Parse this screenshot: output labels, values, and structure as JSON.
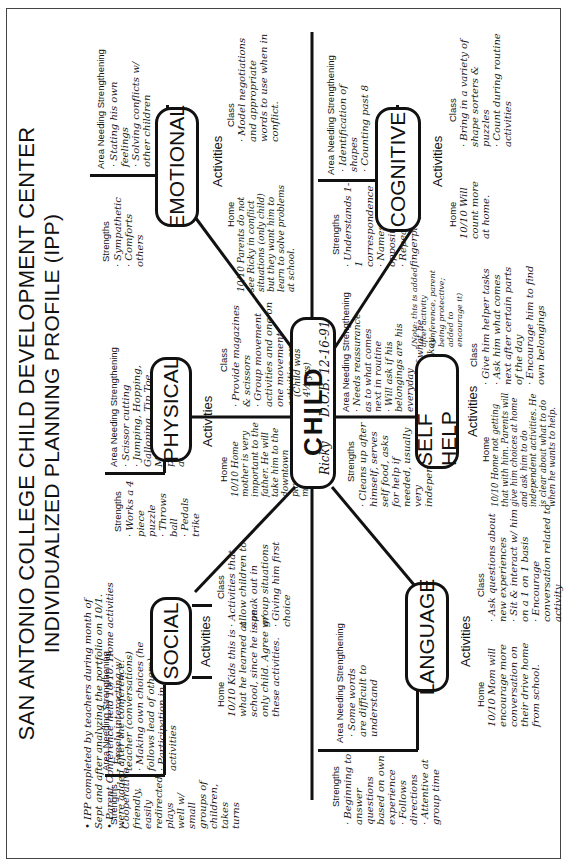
{
  "header": {
    "title_line1": "SAN ANTONIO COLLEGE CHILD DEVELOPMENT CENTER",
    "title_line2": "INDIVIDUALIZED PLANNING PROFILE (IPP)"
  },
  "notes": [
    "• IPP completed by teachers during month of Sept and after analyzing the portfolio on 10/1.",
    "• Parent Conference held 10/10. Home activities were added after the conference."
  ],
  "labels": {
    "strengths": "Strengths",
    "area_needing": "Area Needing Strengthening",
    "activities": "Activities",
    "home": "Home",
    "class": "Class"
  },
  "child": {
    "label": "CHILD",
    "age_note": "(Child was 4½ yrs)",
    "name": "Ricky",
    "dob": "D.O.B. 12-16-91"
  },
  "domains": {
    "social": {
      "label": "SOCIAL",
      "strengths": [
        "Cooperative, friendly, easily redirected, plays well w/ small groups of children, takes turns"
      ],
      "area_needing": [
        "· Freely interacting w/ teacher (conversations)",
        "· Making own choices (he follows lead of others)",
        "· Participation in group activities"
      ],
      "home": "10/10 Kids this is what he learned at school, since he is an only child. Agree w/ these activities.",
      "class": [
        "· Activities that allow children to speak out in group situations",
        "· Giving him first choice"
      ]
    },
    "physical": {
      "label": "PHYSICAL",
      "strengths": [
        "· Works a 4 piece puzzle",
        "· Throws ball",
        "· Pedals trike"
      ],
      "area_needing": [
        "· Scissor cutting",
        "· Jumping, Hopping, Galloping, Tip Toe, Marching (does not participate in these activities)"
      ],
      "home": "10/10 Home mother is very important to the father. He will take him to the downtown playground more often.",
      "class": [
        "· Provide magazines & scissors",
        "· Group movement activities and one on one movement activities on playground"
      ]
    },
    "emotional": {
      "label": "EMOTIONAL",
      "strengths": [
        "· Sympathetic",
        "· Comforts others"
      ],
      "area_needing": [
        "· Stating his own feelings",
        "· Solving conflicts w/ other children"
      ],
      "home": "10/10 Parents do not see Ricky in conflict situations (only child) but they want him to learn to solve problems at school.",
      "class": [
        "· Model negotiations and appropriate words to use when in conflict."
      ]
    },
    "language": {
      "label": "LANGUAGE",
      "strengths": [
        "· Beginning to answer questions based on own experience",
        "· Follows directions",
        "· Attentive at group time"
      ],
      "area_needing": [
        "· Some words are difficult to understand"
      ],
      "home": "10/10 Mom will encourage more conversation on their drive home from school.",
      "class": [
        "· Ask questions about new experiences",
        "· Sit & interact w/ him on a 1 on 1 basis",
        "· Encourage conversation related to activity"
      ]
    },
    "self_help": {
      "label": "SELF HELP",
      "strengths": [
        "· Cleans up after himself, serves self food, asks for help if needed, usually very independent"
      ],
      "area_needing": [
        "· Needs reassurance as to what comes next in routine",
        "· Will ask if his belongings are his everyday",
        "· Unsure if what he is doing is okay"
      ],
      "note": "(Note: this is added after activity conference, parent being protective; added to encourage it)",
      "home": "10/10 Home not getting that with him. Parents will give him choices at home and ask him to do independent activities. He is clear about what to do when he wants to help.",
      "class": [
        "· Give him helper tasks",
        "· Ask him what comes next after certain parts of the day",
        "· Encourage him to find own belongings"
      ]
    },
    "cognitive": {
      "label": "COGNITIVE",
      "strengths": [
        "· Understands 1-1 correspondence",
        "· Names opposites",
        "· Repeats fingerplays"
      ],
      "area_needing": [
        "· Identification of shapes",
        "· Counting past 8"
      ],
      "home": "10/10 Will count more at home.",
      "class": [
        "· Bring in a variety of shape sorters & puzzles",
        "· Count during routine activities"
      ]
    }
  }
}
